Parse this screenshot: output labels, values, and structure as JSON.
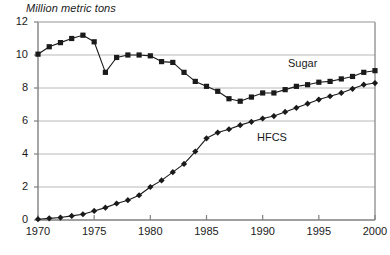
{
  "chart_data": {
    "type": "line",
    "title": "",
    "ylabel": "Million metric tons",
    "xlabel": "",
    "ylim": [
      0,
      12
    ],
    "xlim": [
      1970,
      2000
    ],
    "yticks": [
      0,
      2,
      4,
      6,
      8,
      10,
      12
    ],
    "xticks": [
      1970,
      1975,
      1980,
      1985,
      1990,
      1995,
      2000
    ],
    "grid": "horizontal",
    "legend_position": "inline-annotations",
    "x": [
      1970,
      1971,
      1972,
      1973,
      1974,
      1975,
      1976,
      1977,
      1978,
      1979,
      1980,
      1981,
      1982,
      1983,
      1984,
      1985,
      1986,
      1987,
      1988,
      1989,
      1990,
      1991,
      1992,
      1993,
      1994,
      1995,
      1996,
      1997,
      1998,
      1999,
      2000
    ],
    "series": [
      {
        "name": "Sugar",
        "marker": "square",
        "values": [
          10.05,
          10.5,
          10.75,
          11.0,
          11.2,
          10.8,
          8.95,
          9.85,
          10.0,
          10.0,
          9.95,
          9.6,
          9.55,
          8.95,
          8.4,
          8.1,
          7.8,
          7.35,
          7.2,
          7.45,
          7.7,
          7.7,
          7.9,
          8.1,
          8.2,
          8.35,
          8.4,
          8.55,
          8.7,
          8.95,
          9.05
        ]
      },
      {
        "name": "HFCS",
        "marker": "diamond",
        "values": [
          0.05,
          0.1,
          0.15,
          0.25,
          0.35,
          0.55,
          0.75,
          1.0,
          1.2,
          1.5,
          2.0,
          2.4,
          2.9,
          3.4,
          4.15,
          4.95,
          5.3,
          5.5,
          5.75,
          5.95,
          6.15,
          6.3,
          6.55,
          6.8,
          7.05,
          7.3,
          7.5,
          7.7,
          7.95,
          8.2,
          8.3
        ]
      }
    ],
    "annotations": [
      {
        "text": "Sugar",
        "series": "Sugar"
      },
      {
        "text": "HFCS",
        "series": "HFCS"
      }
    ]
  },
  "colors": {
    "series": "#1a1a1a",
    "grid": "#b8b8b8",
    "axis": "#808080",
    "background": "#ffffff"
  }
}
